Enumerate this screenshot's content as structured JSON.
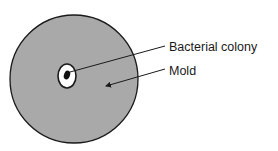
{
  "diagram": {
    "labels": {
      "bacterial_colony": "Bacterial colony",
      "mold": "Mold"
    },
    "colors": {
      "mold_fill": "#a9a9a9",
      "outline": "#1a1a1a",
      "clear_zone": "#ffffff",
      "colony": "#111111",
      "background": "#ffffff"
    }
  }
}
